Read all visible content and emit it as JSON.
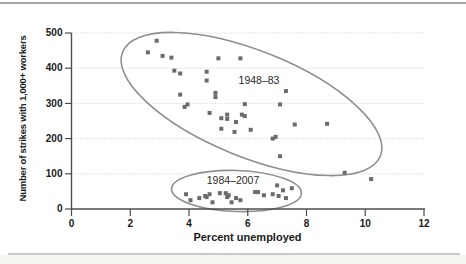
{
  "chart_data": {
    "type": "scatter",
    "title": "",
    "xlabel": "Percent unemployed",
    "ylabel": "Number of strikes with 1,000+ workers",
    "xlim": [
      0,
      12
    ],
    "ylim": [
      0,
      500
    ],
    "xticks": [
      0,
      2,
      4,
      6,
      8,
      10,
      12
    ],
    "yticks": [
      0,
      100,
      200,
      300,
      400,
      500
    ],
    "grid": "horizontal-dotted",
    "marker": "square",
    "series": [
      {
        "name": "1948–83",
        "points": [
          [
            2.9,
            478
          ],
          [
            2.6,
            445
          ],
          [
            3.1,
            435
          ],
          [
            3.4,
            430
          ],
          [
            5.0,
            428
          ],
          [
            5.75,
            428
          ],
          [
            3.5,
            393
          ],
          [
            4.6,
            390
          ],
          [
            3.7,
            385
          ],
          [
            4.6,
            365
          ],
          [
            7.3,
            335
          ],
          [
            4.9,
            330
          ],
          [
            3.7,
            325
          ],
          [
            4.9,
            318
          ],
          [
            5.9,
            298
          ],
          [
            7.1,
            297
          ],
          [
            3.95,
            297
          ],
          [
            3.85,
            290
          ],
          [
            4.7,
            273
          ],
          [
            5.3,
            268
          ],
          [
            5.8,
            268
          ],
          [
            5.9,
            264
          ],
          [
            5.1,
            258
          ],
          [
            5.3,
            256
          ],
          [
            5.6,
            247
          ],
          [
            8.7,
            242
          ],
          [
            7.6,
            240
          ],
          [
            5.1,
            228
          ],
          [
            6.1,
            225
          ],
          [
            5.55,
            219
          ],
          [
            6.95,
            205
          ],
          [
            6.85,
            200
          ],
          [
            7.1,
            150
          ],
          [
            9.3,
            103
          ],
          [
            10.2,
            85
          ]
        ]
      },
      {
        "name": "1984–2007",
        "points": [
          [
            3.9,
            42
          ],
          [
            4.05,
            25
          ],
          [
            4.35,
            31
          ],
          [
            4.55,
            37
          ],
          [
            4.6,
            34
          ],
          [
            4.7,
            42
          ],
          [
            4.8,
            19
          ],
          [
            5.05,
            45
          ],
          [
            5.25,
            45
          ],
          [
            5.3,
            34
          ],
          [
            5.35,
            39
          ],
          [
            5.45,
            19
          ],
          [
            5.6,
            31
          ],
          [
            5.75,
            25
          ],
          [
            6.25,
            48
          ],
          [
            6.35,
            48
          ],
          [
            6.55,
            39
          ],
          [
            6.85,
            42
          ],
          [
            7.0,
            67
          ],
          [
            7.05,
            37
          ],
          [
            7.2,
            53
          ],
          [
            7.3,
            31
          ],
          [
            7.5,
            59
          ]
        ]
      }
    ],
    "annotations": [
      {
        "label": "1948–83",
        "label_px": [
          259,
          81
        ],
        "ellipse_px": {
          "cx": 251.5,
          "cy": 104,
          "rx": 139,
          "ry": 53,
          "rot": 22
        }
      },
      {
        "label": "1984–2007",
        "label_px": [
          233,
          181
        ],
        "ellipse_px": {
          "cx": 236.5,
          "cy": 191,
          "rx": 65,
          "ry": 20.5,
          "rot": 2
        }
      }
    ],
    "layout": {
      "plot_px": {
        "left": 71.5,
        "right": 424,
        "top": 33,
        "bottom": 209
      },
      "marker_size_px": 4
    },
    "colors": {
      "point": "#6b6b6b",
      "ellipse": "#8f8f8f",
      "grid": "#cbcbcb",
      "axis": "#4c4c4c",
      "tick_text": "#1a1a1a",
      "annotation_text": "#2a2a2a"
    }
  }
}
